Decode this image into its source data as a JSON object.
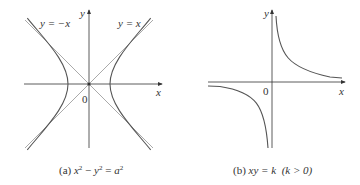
{
  "panel_a": {
    "caption_prefix": "(a) ",
    "caption_eq": {
      "x": "x",
      "sq1": "2",
      "minus": " − ",
      "y": "y",
      "sq2": "2",
      "eq": " = ",
      "a": "a",
      "sq3": "2"
    },
    "asymptote_left_label": "y = −x",
    "asymptote_right_label": "y = x",
    "x_axis_label": "x",
    "y_axis_label": "y",
    "origin_label": "0",
    "curve": "hyperbola x^2 - y^2 = a^2",
    "colors": {
      "curve": "#555555",
      "asymptote": "#aaaaaa",
      "axis": "#333333"
    }
  },
  "panel_b": {
    "caption_prefix": "(b) ",
    "caption_eq": "xy = k",
    "caption_cond": "(k > 0)",
    "x_axis_label": "x",
    "y_axis_label": "y",
    "origin_label": "0",
    "curve": "rectangular hyperbola xy = k, k > 0",
    "colors": {
      "curve": "#555555",
      "axis": "#333333"
    }
  }
}
